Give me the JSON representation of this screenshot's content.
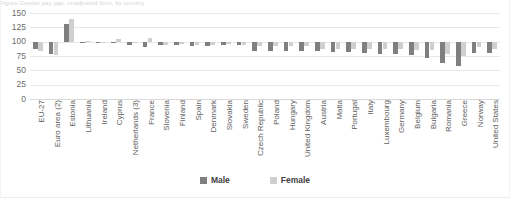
{
  "chart_data": {
    "type": "bar",
    "title": "",
    "xlabel": "",
    "ylabel": "",
    "ylim": [
      0,
      150
    ],
    "yticks": [
      0,
      25,
      50,
      75,
      100,
      125,
      150
    ],
    "grid": true,
    "baseline": 100,
    "legend_position": "bottom-center",
    "orientation": "vertical-grouped",
    "xtick_rotation": 90,
    "categories": [
      "EU-27",
      "Euro area (2)",
      "Estonia",
      "Lithuania",
      "Ireland",
      "Cyprus",
      "Netherlands (3)",
      "France",
      "Slovenia",
      "Finland",
      "Spain",
      "Denmark",
      "Slovakia",
      "Sweden",
      "Czech Republic",
      "Poland",
      "Hungary",
      "United Kingdom",
      "Austria",
      "Malta",
      "Portugal",
      "Italy",
      "Luxembourg",
      "Germany",
      "Belgium",
      "Bulgaria",
      "Romania",
      "Greece",
      "Norway",
      "United States"
    ],
    "series": [
      {
        "name": "Male",
        "color": "#7f7f7f",
        "values": [
          88,
          78,
          130,
          100,
          99,
          100,
          94,
          91,
          95,
          94,
          93,
          93,
          95,
          94,
          84,
          84,
          84,
          84,
          83,
          82,
          82,
          80,
          79,
          78,
          77,
          72,
          62,
          57,
          80,
          80
        ]
      },
      {
        "name": "Female",
        "color": "#cfcfcf",
        "values": [
          84,
          77,
          140,
          101,
          100,
          104,
          100,
          106,
          95,
          96,
          94,
          94,
          96,
          95,
          93,
          92,
          92,
          92,
          88,
          88,
          88,
          88,
          88,
          87,
          86,
          85,
          78,
          75,
          90,
          88
        ]
      }
    ]
  },
  "legend": {
    "items": [
      {
        "label": "Male",
        "color": "#7f7f7f"
      },
      {
        "label": "Female",
        "color": "#cfcfcf"
      }
    ]
  },
  "top_strip": {
    "text": "Figure  Gender pay gap, unadjusted form, by country"
  },
  "colors": {
    "male": "#7f7f7f",
    "female": "#cfcfcf",
    "gridline": "#e8e8e8",
    "tick_text": "#6e6e6e",
    "label_text": "#5e5e5e",
    "background": "#ffffff"
  }
}
